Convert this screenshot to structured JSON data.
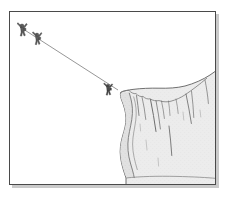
{
  "figure": {
    "title": "Cliff Edge Rope Descent Line Illustration",
    "kind": "line-art-illustration",
    "caption": "",
    "canvas": {
      "width": 226,
      "height": 197,
      "background": "#ffffff"
    },
    "frame": {
      "name": "picture-frame",
      "x": 9,
      "y": 11,
      "width": 207,
      "height": 174,
      "border_color": "#4a4a4a",
      "border_width": 1,
      "fill": "#ffffff",
      "shadow_color": "#b8b8b8",
      "shadow_offset": 3
    },
    "scene": {
      "rope": {
        "name": "rope-line",
        "label": "rope",
        "color": "#8a8a8a",
        "width": 0.9,
        "start_x": 20,
        "start_y": 27,
        "end_x": 118,
        "end_y": 90
      },
      "figures": [
        {
          "name": "climber-figure-1",
          "label": "climber on rope (upper)",
          "x": 22,
          "y": 26,
          "scale": 1.0,
          "color": "#5d5d5d",
          "outline": "#3a3a3a"
        },
        {
          "name": "climber-figure-2",
          "label": "climber on rope (middle)",
          "x": 37,
          "y": 35,
          "scale": 0.95,
          "color": "#5d5d5d",
          "outline": "#3a3a3a"
        },
        {
          "name": "climber-figure-3",
          "label": "climber on rope (lower, at cliff)",
          "x": 108,
          "y": 86,
          "scale": 0.95,
          "color": "#4a4a4a",
          "outline": "#2f2f2f"
        }
      ],
      "cliff": {
        "name": "cliff-rock-face",
        "label": "overhanging cliff",
        "fill": "#ececec",
        "fill_shadow": "#d8d8d8",
        "outline": "#6f6f6f",
        "outline_width": 1,
        "crack_color": "#7a7a7a",
        "top_edge_y": 92,
        "left_edge_x": 118,
        "right_edge_x": 216,
        "bottom_y": 185,
        "cracks": 11
      },
      "ground": {
        "name": "ground-line",
        "label": "cliff base",
        "color": "#8a8a8a",
        "y": 178
      }
    },
    "palette": {
      "ink": "#3a3a3a",
      "mid_gray": "#8a8a8a",
      "light_gray": "#ececec",
      "frame_gray": "#4a4a4a",
      "shadow_gray": "#b8b8b8",
      "paper": "#ffffff"
    }
  }
}
